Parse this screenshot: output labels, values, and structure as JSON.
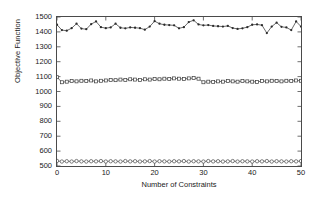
{
  "chart_data": {
    "type": "line",
    "title": "",
    "xlabel": "Number of Constraints",
    "ylabel": "Objective Function",
    "xlim": [
      0,
      50
    ],
    "ylim": [
      500,
      1500
    ],
    "xticks": [
      0,
      10,
      20,
      30,
      40,
      50
    ],
    "yticks": [
      500,
      600,
      700,
      800,
      900,
      1000,
      1100,
      1200,
      1300,
      1400,
      1500
    ],
    "grid": false,
    "legend": "none",
    "x": [
      0,
      1,
      2,
      3,
      4,
      5,
      6,
      7,
      8,
      9,
      10,
      11,
      12,
      13,
      14,
      15,
      16,
      17,
      18,
      19,
      20,
      21,
      22,
      23,
      24,
      25,
      26,
      27,
      28,
      29,
      30,
      31,
      32,
      33,
      34,
      35,
      36,
      37,
      38,
      39,
      40,
      41,
      42,
      43,
      44,
      45,
      46,
      47,
      48,
      49,
      50
    ],
    "series": [
      {
        "name": "upper",
        "marker": "dot",
        "color": "#2b2b2b",
        "values": [
          1448,
          1412,
          1408,
          1425,
          1455,
          1422,
          1418,
          1452,
          1470,
          1432,
          1425,
          1430,
          1455,
          1428,
          1424,
          1430,
          1428,
          1425,
          1415,
          1436,
          1472,
          1455,
          1448,
          1446,
          1444,
          1424,
          1432,
          1466,
          1478,
          1450,
          1444,
          1446,
          1440,
          1438,
          1436,
          1440,
          1426,
          1420,
          1424,
          1432,
          1448,
          1450,
          1445,
          1392,
          1436,
          1462,
          1434,
          1430,
          1412,
          1470,
          1436
        ]
      },
      {
        "name": "middle",
        "marker": "square",
        "color": "#3a3a3a",
        "values": [
          1096,
          1062,
          1066,
          1070,
          1068,
          1072,
          1070,
          1074,
          1068,
          1072,
          1074,
          1078,
          1076,
          1080,
          1078,
          1082,
          1080,
          1078,
          1082,
          1080,
          1084,
          1082,
          1086,
          1084,
          1088,
          1086,
          1084,
          1088,
          1090,
          1086,
          1062,
          1066,
          1064,
          1068,
          1066,
          1070,
          1068,
          1066,
          1070,
          1068,
          1066,
          1064,
          1070,
          1068,
          1072,
          1070,
          1068,
          1072,
          1070,
          1074,
          1072
        ]
      },
      {
        "name": "lower",
        "marker": "circle",
        "color": "#4a4a4a",
        "values": [
          534,
          530,
          532,
          530,
          533,
          531,
          530,
          532,
          531,
          533,
          530,
          532,
          531,
          530,
          533,
          531,
          532,
          530,
          531,
          533,
          530,
          532,
          531,
          530,
          532,
          531,
          533,
          530,
          532,
          531,
          530,
          533,
          531,
          532,
          530,
          531,
          533,
          530,
          532,
          531,
          530,
          532,
          531,
          533,
          530,
          532,
          531,
          530,
          532,
          531,
          533
        ]
      }
    ]
  }
}
